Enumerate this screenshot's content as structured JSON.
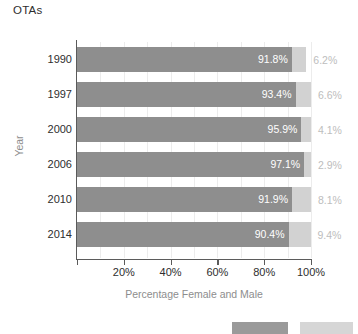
{
  "chart_data": {
    "type": "bar",
    "subtype": "stacked-horizontal-100",
    "title": "OTAs",
    "xlabel": "Percentage Female and Male",
    "ylabel": "Year",
    "categories": [
      "1990",
      "1997",
      "2000",
      "2006",
      "2010",
      "2014"
    ],
    "series": [
      {
        "name": "Female",
        "color": "#8e8e8e",
        "values": [
          91.8,
          93.4,
          95.9,
          97.1,
          91.9,
          90.4
        ],
        "labels": [
          "91.8%",
          "93.4%",
          "95.9%",
          "97.1%",
          "91.9%",
          "90.4%"
        ]
      },
      {
        "name": "Male",
        "color": "#d2d2d2",
        "values": [
          6.2,
          6.6,
          4.1,
          2.9,
          8.1,
          9.4
        ],
        "labels": [
          "6.2%",
          "6.6%",
          "4.1%",
          "2.9%",
          "8.1%",
          "9.4%"
        ]
      }
    ],
    "xlim": [
      0,
      100
    ],
    "xticks": [
      0,
      20,
      40,
      60,
      80,
      100
    ],
    "xtick_labels": [
      "",
      "20%",
      "40%",
      "60%",
      "80%",
      "100%"
    ],
    "gridlines": [
      10,
      20,
      30,
      40,
      50,
      60,
      70,
      80,
      90,
      100
    ],
    "grid": true,
    "legend_position": "bottom",
    "legend_entries": [
      {
        "name": "legend-swatch-female",
        "color": "#9a9a9a",
        "label": ""
      },
      {
        "name": "legend-swatch-male",
        "color": "#d6d6d6",
        "label": ""
      }
    ]
  },
  "colors": {
    "female_bar": "#8e8e8e",
    "male_bar": "#d2d2d2",
    "female_label": "#ffffff",
    "male_label": "#bdbdbd",
    "axis": "#5b5b5b",
    "grid": "#ececec",
    "axis_title": "#8d8d8d",
    "tick_text": "#2e2e2e"
  }
}
